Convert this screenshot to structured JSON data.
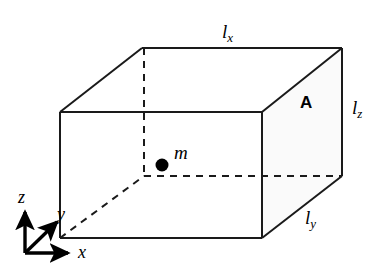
{
  "figure": {
    "background_color": "#ffffff",
    "line_color": "#1a1a1a",
    "shaded_face_color": "#fafafa",
    "width": 385,
    "height": 268
  },
  "labels": {
    "length_x": {
      "symbol": "l",
      "subscript": "x",
      "x": 222,
      "y": 22
    },
    "length_z": {
      "symbol": "l",
      "subscript": "z",
      "x": 352,
      "y": 98
    },
    "length_y": {
      "symbol": "l",
      "subscript": "y",
      "x": 305,
      "y": 208
    },
    "area_face": {
      "text": "A",
      "x": 300,
      "y": 94
    },
    "mass": {
      "text": "m",
      "x": 174,
      "y": 143
    }
  },
  "axes": {
    "origin": {
      "x": 25,
      "y": 253
    },
    "items": [
      {
        "name": "z",
        "label": "z",
        "label_x": 18,
        "label_y": 188,
        "tip_x": 25,
        "tip_y": 209
      },
      {
        "name": "x",
        "label": "x",
        "label_x": 78,
        "label_y": 243,
        "tip_x": 72,
        "tip_y": 253
      },
      {
        "name": "y",
        "label": "y",
        "label_x": 57,
        "label_y": 205,
        "tip_x": 60,
        "tip_y": 219
      }
    ]
  },
  "box": {
    "front_face": {
      "x1": 60,
      "y1": 112,
      "x2": 262,
      "y2": 238
    },
    "depth_offset": {
      "dx": 82,
      "dy": -64
    },
    "mass_point": {
      "cx": 162,
      "cy": 165,
      "r": 6.5
    },
    "hidden_edges_style": "dashed"
  }
}
